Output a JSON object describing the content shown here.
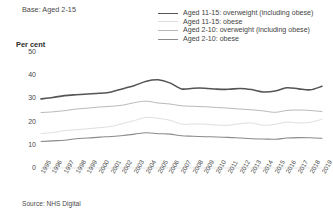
{
  "base_note": "Base: Aged 2-15",
  "axis_title": "Per cent",
  "source": "Source: NHS Digital",
  "colors": {
    "series_1": "#555555",
    "series_2": "#c9c9c9",
    "series_3": "#a8a8a8",
    "series_4": "#7d7d7d",
    "text": "#3f3f3f"
  },
  "legend": {
    "items": [
      {
        "label": "Aged 11-15: overweight (including obese)",
        "color": "#555555",
        "width": 1.6
      },
      {
        "label": "Aged 11-15: obese",
        "color": "#dcdcdc",
        "width": 1.0
      },
      {
        "label": "Aged 2-10: overweight (including obese)",
        "color": "#b5b5b5",
        "width": 1.0
      },
      {
        "label": "Aged 2-10: obese",
        "color": "#8a8a8a",
        "width": 1.1
      }
    ]
  },
  "chart_data": {
    "type": "line",
    "title": "",
    "subtitle": "",
    "xlabel": "",
    "ylabel": "Per cent",
    "ylim": [
      0,
      50
    ],
    "yticks": [
      0,
      10,
      20,
      30,
      40,
      50
    ],
    "grid": false,
    "legend_position": "top-right",
    "x": [
      1995,
      1996,
      1997,
      1998,
      1999,
      2000,
      2001,
      2002,
      2003,
      2004,
      2005,
      2006,
      2007,
      2008,
      2009,
      2010,
      2011,
      2012,
      2013,
      2014,
      2015,
      2016,
      2017,
      2018,
      2019
    ],
    "categories": [
      "1995",
      "1996",
      "1997",
      "1998",
      "1999",
      "2000",
      "2001",
      "2002",
      "2003",
      "2004",
      "2005",
      "2006",
      "2007",
      "2008",
      "2009",
      "2010",
      "2011",
      "2012",
      "2013",
      "2014",
      "2015",
      "2016",
      "2017",
      "2018",
      "2019"
    ],
    "series": [
      {
        "name": "Aged 11-15: overweight (including obese)",
        "color": "#555555",
        "values": [
          29.8,
          30.4,
          31.2,
          31.6,
          31.9,
          32.2,
          32.8,
          34.2,
          35.6,
          37.4,
          38.0,
          36.7,
          34.1,
          34.4,
          34.4,
          34.0,
          33.9,
          34.3,
          33.8,
          32.8,
          33.2,
          34.6,
          34.1,
          33.7,
          35.2
        ]
      },
      {
        "name": "Aged 11-15: obese",
        "color": "#dcdcdc",
        "values": [
          14.8,
          15.3,
          16.1,
          16.5,
          16.9,
          17.4,
          17.9,
          19.2,
          20.5,
          21.8,
          21.4,
          20.6,
          18.9,
          19.0,
          18.9,
          18.5,
          18.4,
          19.1,
          19.4,
          18.4,
          18.8,
          19.8,
          19.4,
          19.7,
          21.0
        ]
      },
      {
        "name": "Aged 2-10: overweight (including obese)",
        "color": "#b5b5b5",
        "values": [
          23.9,
          24.2,
          24.7,
          25.4,
          25.8,
          26.3,
          26.6,
          27.1,
          28.2,
          28.8,
          28.0,
          27.6,
          26.8,
          26.6,
          26.4,
          26.1,
          25.8,
          25.4,
          25.1,
          24.6,
          24.0,
          24.8,
          25.0,
          24.8,
          24.3
        ]
      },
      {
        "name": "Aged 2-10: obese",
        "color": "#8a8a8a",
        "values": [
          11.4,
          11.7,
          12.0,
          12.6,
          12.9,
          13.3,
          13.6,
          14.0,
          14.6,
          15.2,
          14.8,
          14.6,
          13.9,
          13.7,
          13.5,
          13.4,
          13.2,
          12.9,
          12.6,
          12.5,
          12.4,
          12.9,
          13.1,
          13.0,
          12.8
        ]
      }
    ]
  },
  "plot_geometry": {
    "left": 41,
    "right": 322,
    "top": 52,
    "bottom": 168
  }
}
